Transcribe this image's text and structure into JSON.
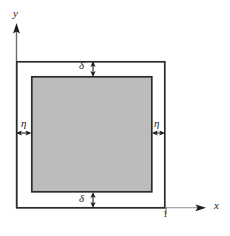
{
  "figure": {
    "type": "technical-diagram",
    "background_color": "#ffffff"
  },
  "axes": {
    "y_label": "y",
    "x_label": "x",
    "axis_color": "#6e6e6e",
    "arrow_color": "#1c1c1c",
    "y_axis": {
      "x": 16,
      "top": 24,
      "bottom": 208
    },
    "x_axis": {
      "y": 208,
      "left": 16,
      "right": 206
    }
  },
  "ticks": [
    {
      "label": "1",
      "axis": "x",
      "x": 166,
      "value": 1
    }
  ],
  "outer_square": {
    "x": 16,
    "y": 61,
    "width": 149,
    "height": 147,
    "fill": "#ffffff",
    "stroke": "#2b2b2b",
    "stroke_width": 1.6
  },
  "inner_square": {
    "x": 31,
    "y": 76,
    "width": 121,
    "height": 116,
    "fill": "#bcbcbc",
    "stroke": "#2b2b2b",
    "stroke_width": 1.6
  },
  "dimensions": [
    {
      "name": "delta-top",
      "label": "δ",
      "orientation": "vertical",
      "arrow_x": 93,
      "from_y": 61,
      "to_y": 76
    },
    {
      "name": "delta-bottom",
      "label": "δ",
      "orientation": "vertical",
      "arrow_x": 93,
      "from_y": 192,
      "to_y": 208
    },
    {
      "name": "eta-left",
      "label": "η",
      "orientation": "horizontal",
      "arrow_y": 133,
      "from_x": 16,
      "to_x": 31
    },
    {
      "name": "eta-right",
      "label": "η",
      "orientation": "horizontal",
      "arrow_y": 133,
      "from_x": 152,
      "to_x": 165
    }
  ],
  "colors": {
    "shaded_region": "#bcbcbc",
    "outline": "#2b2b2b",
    "axis": "#6e6e6e",
    "text": "#1c1c1c"
  }
}
